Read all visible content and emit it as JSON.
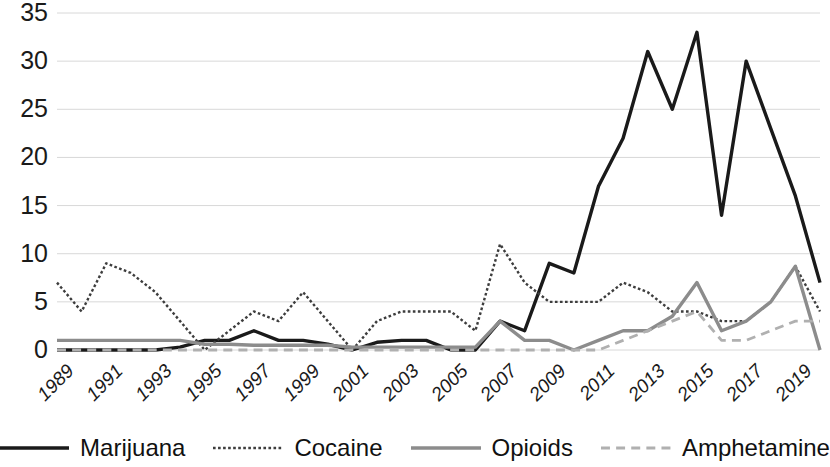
{
  "chart_data": {
    "type": "line",
    "title": "",
    "subtitle": "",
    "xlabel": "",
    "ylabel": "",
    "grid": true,
    "legend_position": "bottom",
    "xlim": [
      1989,
      2020
    ],
    "ylim": [
      0,
      35
    ],
    "yticks": [
      0,
      5,
      10,
      15,
      20,
      25,
      30,
      35
    ],
    "ytick_labels": [
      "0",
      "5",
      "10",
      "15",
      "20",
      "25",
      "30",
      "35"
    ],
    "x": [
      1989,
      1990,
      1991,
      1992,
      1993,
      1994,
      1995,
      1996,
      1997,
      1998,
      1999,
      2000,
      2001,
      2002,
      2003,
      2004,
      2005,
      2006,
      2007,
      2008,
      2009,
      2010,
      2011,
      2012,
      2013,
      2014,
      2015,
      2016,
      2017,
      2018,
      2019,
      2020
    ],
    "xtick_labels": [
      "1989",
      "1991",
      "1993",
      "1995",
      "1997",
      "1999",
      "2001",
      "2003",
      "2005",
      "2007",
      "2009",
      "2011",
      "2013",
      "2015",
      "2017",
      "2019"
    ],
    "series": [
      {
        "name": "Marijuana",
        "color": "#1a1a1a",
        "style": "solid",
        "width": 3.4,
        "values": [
          0,
          0,
          0,
          0,
          0,
          0.3,
          1,
          1,
          2,
          1,
          1,
          0.6,
          0,
          0.8,
          1,
          1,
          0,
          0,
          3,
          2,
          9,
          8,
          17,
          22,
          31,
          25,
          33,
          14,
          30,
          23,
          16,
          7
        ]
      },
      {
        "name": "Cocaine",
        "color": "#3d3d3d",
        "style": "dotted",
        "width": 2.4,
        "values": [
          7,
          4,
          9,
          8,
          6,
          3,
          0,
          2,
          4,
          3,
          6,
          3,
          0,
          3,
          4,
          4,
          4,
          2,
          11,
          7,
          5,
          5,
          5,
          7,
          6,
          4,
          4,
          3,
          3,
          5,
          8.7,
          4
        ]
      },
      {
        "name": "Opioids",
        "color": "#8c8c8c",
        "style": "solid",
        "width": 3.4,
        "values": [
          1,
          1,
          1,
          1,
          1,
          1,
          0.6,
          0.6,
          0.5,
          0.5,
          0.5,
          0.5,
          0.3,
          0.3,
          0.3,
          0.3,
          0.3,
          0.3,
          3,
          1,
          1,
          0,
          1,
          2,
          2,
          3.5,
          7,
          2,
          3,
          5,
          8.7,
          0
        ]
      },
      {
        "name": "Amphetamine",
        "color": "#b0b0b0",
        "style": "dashed",
        "width": 2.8,
        "values": [
          0,
          0,
          0,
          0,
          0,
          0,
          0,
          0,
          0,
          0,
          0,
          0,
          0,
          0,
          0,
          0,
          0,
          0,
          0,
          0,
          0,
          0,
          0,
          1,
          2,
          3,
          4,
          1,
          1,
          2,
          3,
          3
        ]
      }
    ]
  },
  "axes": {
    "y_tick_labels": [
      "35",
      "30",
      "25",
      "20",
      "15",
      "10",
      "5",
      "0"
    ],
    "x_tick_labels": [
      "1989",
      "1991",
      "1993",
      "1995",
      "1997",
      "1999",
      "2001",
      "2003",
      "2005",
      "2007",
      "2009",
      "2011",
      "2013",
      "2015",
      "2017",
      "2019"
    ]
  },
  "legend": {
    "items": [
      {
        "label": "Marijuana",
        "icon": "solid-line-icon"
      },
      {
        "label": "Cocaine",
        "icon": "dotted-line-icon"
      },
      {
        "label": "Opioids",
        "icon": "solid-gray-line-icon"
      },
      {
        "label": "Amphetamine",
        "icon": "dashed-gray-line-icon"
      }
    ]
  }
}
